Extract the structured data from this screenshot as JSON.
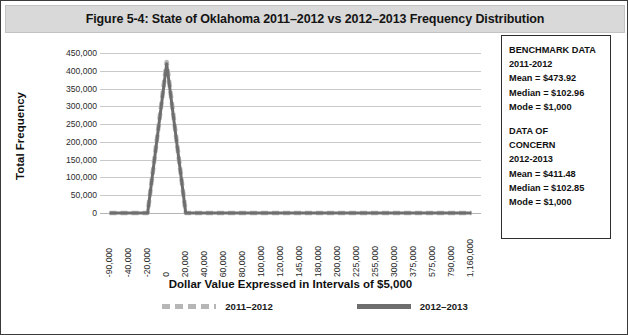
{
  "figure": {
    "title": "Figure 5-4: State of Oklahoma 2011–2012 vs 2012–2013 Frequency Distribution"
  },
  "chart_data": {
    "type": "line",
    "title": "Figure 5-4: State of Oklahoma 2011–2012 vs 2012–2013 Frequency Distribution",
    "xlabel": "Dollar Value Expressed in Intervals of $5,000",
    "ylabel": "Total Frequency",
    "ylim": [
      0,
      450000
    ],
    "ytick_step": 50000,
    "yticks": [
      "450,000",
      "400,000",
      "350,000",
      "300,000",
      "250,000",
      "200,000",
      "150,000",
      "100,000",
      "50,000",
      "0"
    ],
    "grid": true,
    "legend_position": "bottom",
    "categories": [
      "-90,000",
      "-40,000",
      "-20,000",
      "0",
      "20,000",
      "40,000",
      "60,000",
      "80,000",
      "100,000",
      "120,000",
      "145,000",
      "180,000",
      "200,000",
      "225,000",
      "255,000",
      "300,000",
      "375,000",
      "575,000",
      "790,000",
      "1,160,000"
    ],
    "series": [
      {
        "name": "2011–2012",
        "color": "#b6b6b6",
        "style": "dashed",
        "values": [
          0,
          0,
          0,
          425000,
          0,
          0,
          0,
          0,
          0,
          0,
          0,
          0,
          0,
          0,
          0,
          0,
          0,
          0,
          0,
          0
        ]
      },
      {
        "name": "2012–2013",
        "color": "#6e6e6e",
        "style": "solid",
        "values": [
          0,
          0,
          0,
          420000,
          0,
          0,
          0,
          0,
          0,
          0,
          0,
          0,
          0,
          0,
          0,
          0,
          0,
          0,
          0,
          0
        ]
      }
    ],
    "annotations": {
      "benchmark": {
        "heading": "BENCHMARK DATA",
        "period": "2011-2012",
        "mean": "Mean = $473.92",
        "median": "Median = $102.96",
        "mode": "Mode = $1,000"
      },
      "concern": {
        "heading_line1": "DATA OF",
        "heading_line2": "CONCERN",
        "period": "2012-2013",
        "mean": "Mean = $411.48",
        "median": "Median = $102.85",
        "mode": "Mode = $1,000"
      }
    }
  },
  "legend": {
    "items": [
      {
        "label": "2011–2012"
      },
      {
        "label": "2012–2013"
      }
    ]
  }
}
